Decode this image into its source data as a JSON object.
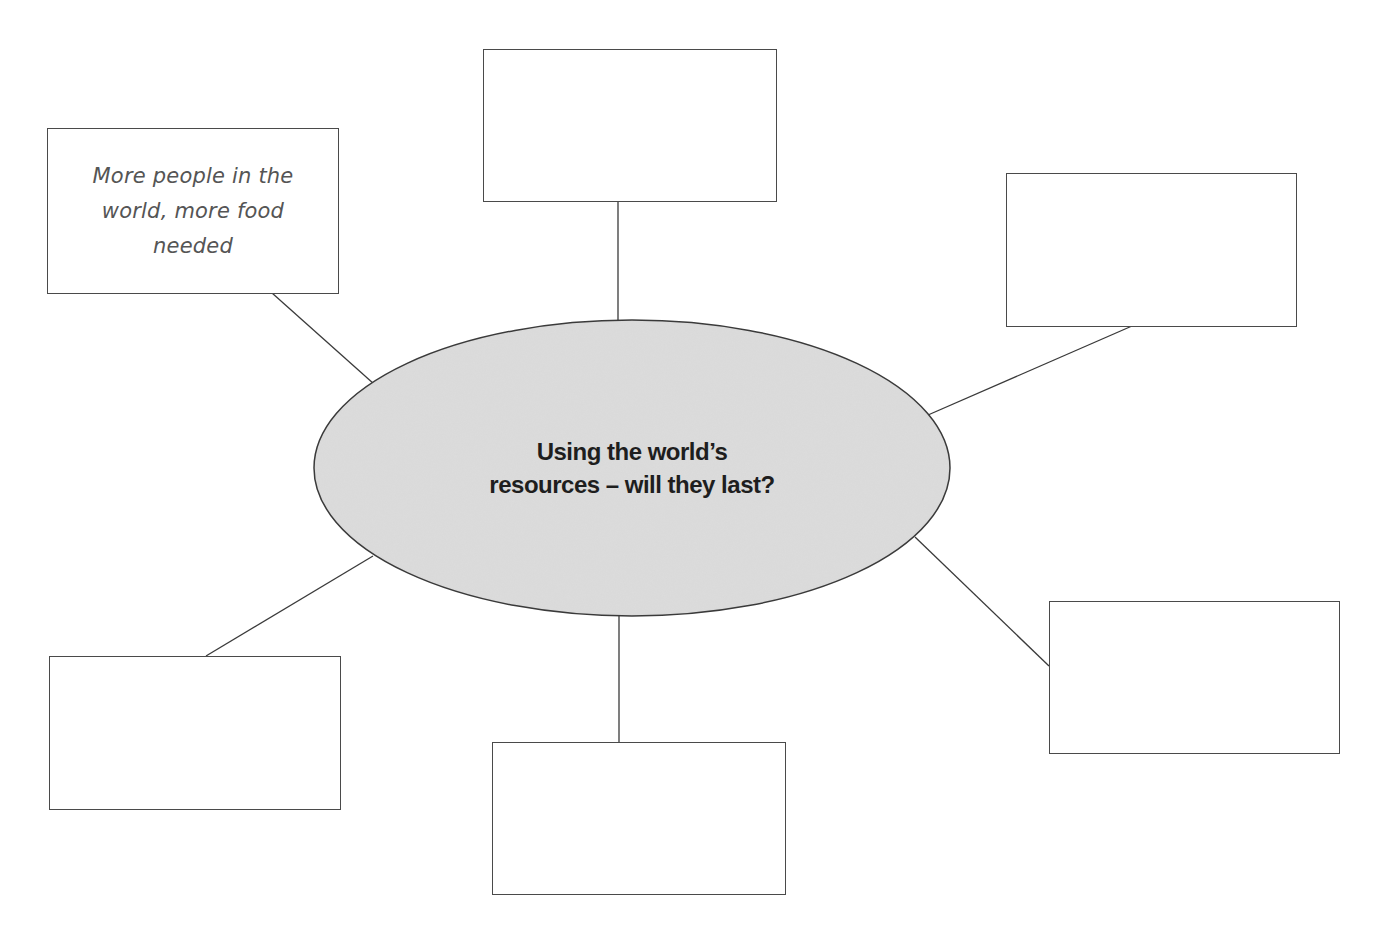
{
  "diagram": {
    "type": "mind-map",
    "center": {
      "line1": "Using the world’s",
      "line2": "resources – will they last?",
      "fill": "#d9d9d9",
      "stroke": "#3a3a3a"
    },
    "boxes": [
      {
        "id": "top-left",
        "text": [
          "More people in the",
          "world, more food",
          "needed"
        ]
      },
      {
        "id": "top",
        "text": []
      },
      {
        "id": "top-right",
        "text": []
      },
      {
        "id": "bottom-left",
        "text": []
      },
      {
        "id": "bottom",
        "text": []
      },
      {
        "id": "bottom-right",
        "text": []
      }
    ]
  }
}
